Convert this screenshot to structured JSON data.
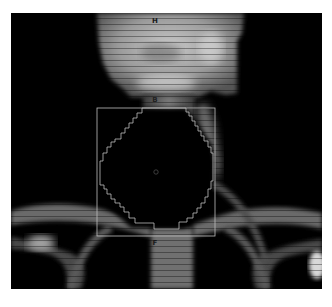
{
  "image": {
    "description": "Coronal radiographic reconstruction of neck and upper thorax with circular region of interest",
    "background_color": "#000000",
    "frame_color": "#ffffff"
  },
  "roi": {
    "box_color": "#bdbdbd",
    "contour_color": "#bdbdbd",
    "center_marker": "circle"
  },
  "markers": {
    "top": "H",
    "middle": "B",
    "bottom": "F"
  }
}
